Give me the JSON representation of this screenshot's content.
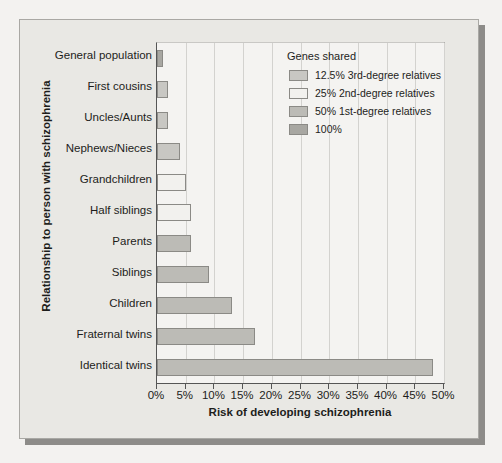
{
  "chart_data": {
    "type": "bar",
    "orientation": "horizontal",
    "title": "",
    "xlabel": "Risk of developing schizophrenia",
    "ylabel": "Relationship to person with schizophrenia",
    "xlim": [
      0,
      50
    ],
    "xunit": "%",
    "grid": true,
    "xticks": [
      0,
      5,
      10,
      15,
      20,
      25,
      30,
      35,
      40,
      45,
      50
    ],
    "xtick_labels": [
      "0%",
      "5%",
      "10%",
      "15%",
      "20%",
      "25%",
      "30%",
      "35%",
      "40%",
      "45%",
      "50%"
    ],
    "categories": [
      "General population",
      "First cousins",
      "Uncles/Aunts",
      "Nephews/Nieces",
      "Grandchildren",
      "Half siblings",
      "Parents",
      "Siblings",
      "Children",
      "Fraternal twins",
      "Identical twins"
    ],
    "values": [
      1,
      2,
      2,
      4,
      5,
      6,
      6,
      9,
      13,
      17,
      48
    ],
    "group_keys": [
      "g100",
      "g125",
      "g125",
      "g125",
      "g25",
      "g25",
      "g50",
      "g50",
      "g50",
      "g50",
      "g50"
    ],
    "bars": [
      {
        "label": "General population",
        "value": 1,
        "group": "g100",
        "color": "#a8a7a2"
      },
      {
        "label": "First cousins",
        "value": 2,
        "group": "g125",
        "color": "#c8c7c3"
      },
      {
        "label": "Uncles/Aunts",
        "value": 2,
        "group": "g125",
        "color": "#c8c7c3"
      },
      {
        "label": "Nephews/Nieces",
        "value": 4,
        "group": "g125",
        "color": "#c8c7c3"
      },
      {
        "label": "Grandchildren",
        "value": 5,
        "group": "g25",
        "color": "#f2f1ee"
      },
      {
        "label": "Half siblings",
        "value": 6,
        "group": "g25",
        "color": "#f2f1ee"
      },
      {
        "label": "Parents",
        "value": 6,
        "group": "g50",
        "color": "#bcbbb6"
      },
      {
        "label": "Siblings",
        "value": 9,
        "group": "g50",
        "color": "#bcbbb6"
      },
      {
        "label": "Children",
        "value": 13,
        "group": "g50",
        "color": "#bcbbb6"
      },
      {
        "label": "Fraternal twins",
        "value": 17,
        "group": "g50",
        "color": "#bcbbb6"
      },
      {
        "label": "Identical twins",
        "value": 48,
        "group": "g50",
        "color": "#bcbbb6"
      }
    ],
    "legend": {
      "position": "top-right",
      "title": "Genes shared",
      "entries": [
        {
          "key": "g125",
          "label": "12.5% 3rd-degree relatives",
          "color": "#c8c7c3"
        },
        {
          "key": "g25",
          "label": "25% 2nd-degree relatives",
          "color": "#f2f1ee"
        },
        {
          "key": "g50",
          "label": "50% 1st-degree relatives",
          "color": "#bcbbb6"
        },
        {
          "key": "g100",
          "label": "100%",
          "color": "#a8a7a2"
        }
      ]
    }
  },
  "colors": {
    "page_background": "#f3f2f0",
    "frame_background": "#e9e8e4",
    "plot_background": "#f4f3f1",
    "axis": "#555555",
    "gridline": "#d3d2cf",
    "text": "#1d1d1b",
    "shadow": "#8d8c89"
  }
}
